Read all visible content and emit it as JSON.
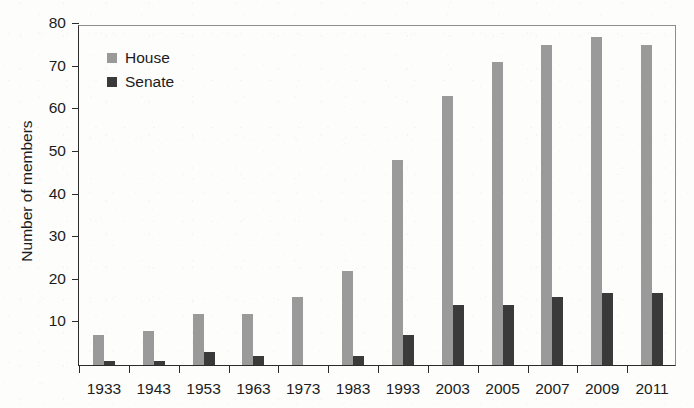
{
  "chart_data": {
    "type": "bar",
    "title": "",
    "xlabel": "",
    "ylabel": "Number of members",
    "categories": [
      "1933",
      "1943",
      "1953",
      "1963",
      "1973",
      "1983",
      "1993",
      "2003",
      "2005",
      "2007",
      "2009",
      "2011"
    ],
    "series": [
      {
        "name": "House",
        "color": "#9a9a9a",
        "values": [
          7,
          8,
          12,
          12,
          16,
          22,
          48,
          63,
          71,
          75,
          77,
          75
        ]
      },
      {
        "name": "Senate",
        "color": "#3a3a3a",
        "values": [
          1,
          1,
          3,
          2,
          0,
          2,
          7,
          14,
          14,
          16,
          17,
          17
        ]
      }
    ],
    "ylim": [
      0,
      80
    ],
    "yticks": [
      10,
      20,
      30,
      40,
      50,
      60,
      70,
      80
    ],
    "ytick_labels": [
      "10",
      "20",
      "30",
      "40",
      "50",
      "60",
      "70",
      "80"
    ],
    "grid": false,
    "legend_position": "upper-left"
  },
  "legend": {
    "items": [
      {
        "label": "House",
        "color": "#9a9a9a"
      },
      {
        "label": "Senate",
        "color": "#3a3a3a"
      }
    ]
  },
  "colors": {
    "house": "#9a9a9a",
    "senate": "#3a3a3a",
    "axis": "#2b2b2b",
    "frame": "#8d8d8d",
    "text": "#1c1c1c",
    "background": "#fdfdfc"
  }
}
